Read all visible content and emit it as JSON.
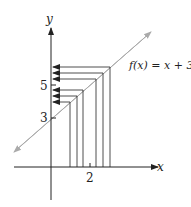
{
  "diagram": {
    "function_label": "f(x) = x + 3",
    "function_label_parts": {
      "f": "f",
      "open": "(",
      "x": "x",
      "rest": ") = ",
      "x2": "x",
      "plus": " + 3"
    },
    "x_axis_label": "x",
    "y_axis_label": "y",
    "x_tick_label": "2",
    "y_tick_labels": [
      "3",
      "5"
    ],
    "line_color": "#aaaaaa",
    "axis_color": "#222222",
    "input_x_values": [
      "approx 1.4",
      "1.6",
      "1.8",
      "2.2",
      "2.4",
      "2.6"
    ]
  }
}
